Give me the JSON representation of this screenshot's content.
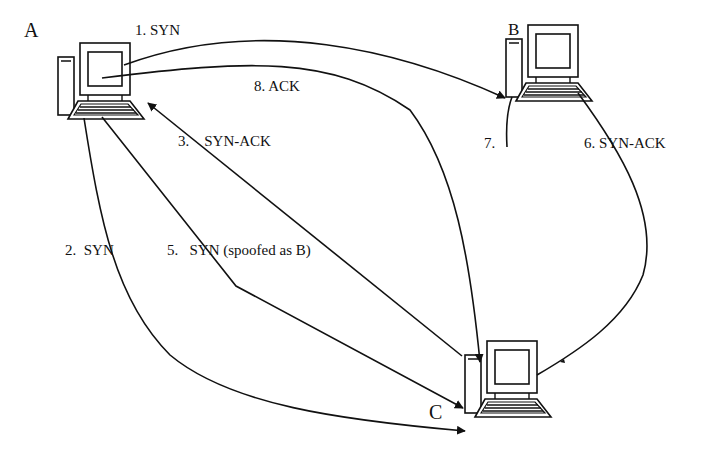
{
  "diagram": {
    "type": "network-sequence",
    "nodes": [
      {
        "id": "A",
        "label": "A",
        "icon": "desktop-computer-icon"
      },
      {
        "id": "B",
        "label": "B",
        "icon": "desktop-computer-icon"
      },
      {
        "id": "C",
        "label": "C",
        "icon": "desktop-computer-icon"
      }
    ],
    "edges": [
      {
        "step": "1.",
        "label": "SYN",
        "from": "A",
        "to": "B",
        "text": "1. SYN"
      },
      {
        "step": "2.",
        "label": "SYN",
        "from": "A",
        "to": "C",
        "text": "2.  SYN"
      },
      {
        "step": "3.",
        "label": "SYN-ACK",
        "from": "C",
        "to": "A",
        "text": "3.    SYN-ACK"
      },
      {
        "step": "5.",
        "label": "SYN (spoofed as B)",
        "from": "A",
        "to": "C",
        "text": "5.   SYN (spoofed as B)"
      },
      {
        "step": "6.",
        "label": "SYN-ACK",
        "from": "C",
        "to": "B",
        "text": "6. SYN-ACK"
      },
      {
        "step": "7.",
        "label": "",
        "from": "B",
        "to": "",
        "text": "7."
      },
      {
        "step": "8.",
        "label": "ACK",
        "from": "A",
        "to": "C",
        "text": "8. ACK"
      }
    ]
  }
}
